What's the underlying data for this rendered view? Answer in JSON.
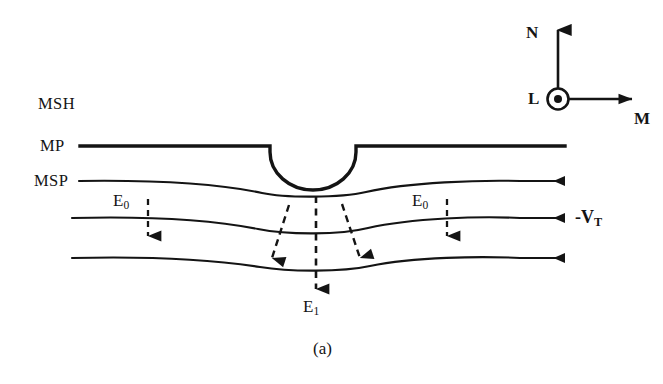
{
  "figure": {
    "caption": "(a)",
    "background_color": "#ffffff",
    "ink_color": "#141414"
  },
  "region_labels": {
    "magnetosheath": "MSH",
    "magnetopause": "MP",
    "magnetospheric_boundary": "MSP"
  },
  "field_labels": {
    "ambient_left": "E",
    "ambient_left_sub": "0",
    "ambient_right": "E",
    "ambient_right_sub": "0",
    "enhanced_center": "E",
    "enhanced_center_sub": "1",
    "tangential_velocity": "-V",
    "tangential_velocity_sub": "T"
  },
  "coordinate_axes": {
    "north_label": "N",
    "normal_out_of_page_label": "L",
    "merging_label": "M",
    "out_of_page_marker": "circle-with-dot"
  },
  "icons": {
    "flow_arrow": "left-arrow-icon",
    "field_arrow": "down-dashed-arrow-icon",
    "axis_n": "up-arrow-icon",
    "axis_m": "right-arrow-icon",
    "axis_l": "out-of-page-icon"
  },
  "geometry": {
    "boundary_lines": 4,
    "notch_type": "semicircular-indentation",
    "flow_arrow_count": 3,
    "dashed_arrow_count": 5
  }
}
